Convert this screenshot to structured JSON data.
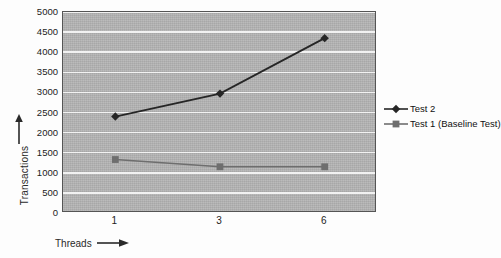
{
  "chart_data": {
    "type": "line",
    "title": "",
    "subtitle": "",
    "xlabel": "Threads",
    "ylabel": "Transactions",
    "categories": [
      "1",
      "3",
      "6"
    ],
    "x": [
      1,
      3,
      6
    ],
    "ylim": [
      0,
      5000
    ],
    "yticks": [
      0,
      500,
      1000,
      1500,
      2000,
      2500,
      3000,
      3500,
      4000,
      4500,
      5000
    ],
    "ytick_labels": [
      "0",
      "500",
      "1000",
      "1500",
      "2000",
      "2500",
      "3000",
      "3500",
      "4000",
      "4500",
      "5000"
    ],
    "grid": "horizontal",
    "legend_position": "right",
    "plot_background": "#b4b4b4",
    "gridline_color": "#f2f2f2",
    "series": [
      {
        "name": "Test 2",
        "marker": "diamond",
        "color": "#262626",
        "values": [
          2400,
          2970,
          4350
        ]
      },
      {
        "name": "Test 1 (Baseline Test)",
        "marker": "square",
        "color": "#6e6e6e",
        "values": [
          1330,
          1150,
          1150
        ]
      }
    ]
  },
  "axes": {
    "y_title": "Transactions",
    "x_title": "Threads",
    "y_arrow_icon": "arrow-up-icon",
    "x_arrow_icon": "arrow-right-icon"
  },
  "legend": {
    "entries": [
      {
        "label": "Test 2",
        "marker": "diamond-marker-icon",
        "color": "#262626"
      },
      {
        "label": "Test 1 (Baseline Test)",
        "marker": "square-marker-icon",
        "color": "#6e6e6e"
      }
    ]
  }
}
